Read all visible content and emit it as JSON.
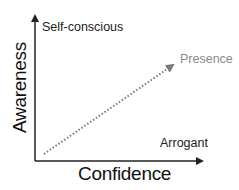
{
  "diagram": {
    "x_axis_label": "Confidence",
    "y_axis_label": "Awareness",
    "top_left_label": "Self-conscious",
    "bottom_right_label": "Arrogant",
    "arrow_target_label": "Presence",
    "colors": {
      "axis": "#222222",
      "dotted_arrow": "#7a7a7a",
      "presence_text": "#8a8a8a"
    }
  }
}
